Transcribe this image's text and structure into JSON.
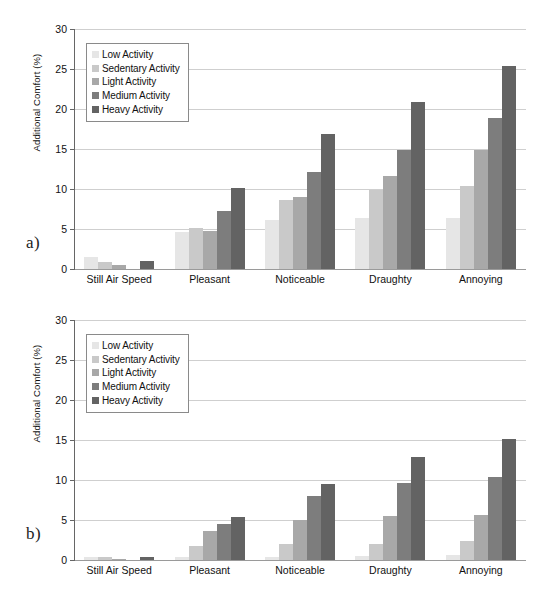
{
  "figure": {
    "panels": [
      {
        "id": "a",
        "label": "a)"
      },
      {
        "id": "b",
        "label": "b)"
      }
    ],
    "series_colors": [
      "#e6e6e6",
      "#c9c9c9",
      "#a8a8a8",
      "#7d7d7d",
      "#636363"
    ],
    "axis": {
      "ylabel": "Additional Comfort (%)",
      "yticks": [
        "0",
        "5",
        "10",
        "15",
        "20",
        "25",
        "30"
      ],
      "ymin": 0,
      "ymax": 30
    },
    "legend": {
      "items": [
        {
          "label": "Low Activity"
        },
        {
          "label": "Sedentary Activity"
        },
        {
          "label": "Light Activity"
        },
        {
          "label": "Medium Activity"
        },
        {
          "label": "Heavy Activity"
        }
      ]
    }
  },
  "chart_data": [
    {
      "type": "bar",
      "panel": "a",
      "title": "",
      "xlabel": "",
      "ylabel": "Additional Comfort (%)",
      "ylim": [
        0,
        30
      ],
      "yticks": [
        0,
        5,
        10,
        15,
        20,
        25,
        30
      ],
      "grid": true,
      "legend_position": "upper-left",
      "categories": [
        "Still Air Speed",
        "Pleasant",
        "Noticeable",
        "Draughty",
        "Annoying"
      ],
      "series": [
        {
          "name": "Low Activity",
          "values": [
            1.4,
            4.5,
            6.0,
            6.3,
            6.3
          ]
        },
        {
          "name": "Sedentary Activity",
          "values": [
            0.8,
            5.0,
            8.5,
            9.8,
            10.3
          ]
        },
        {
          "name": "Light Activity",
          "values": [
            0.4,
            4.6,
            8.9,
            11.5,
            14.7
          ]
        },
        {
          "name": "Medium Activity",
          "values": [
            0.0,
            7.1,
            12.0,
            14.8,
            18.8
          ]
        },
        {
          "name": "Heavy Activity",
          "values": [
            0.9,
            10.0,
            16.7,
            20.7,
            25.2
          ]
        }
      ]
    },
    {
      "type": "bar",
      "panel": "b",
      "title": "",
      "xlabel": "",
      "ylabel": "Additional Comfort (%)",
      "ylim": [
        0,
        30
      ],
      "yticks": [
        0,
        5,
        10,
        15,
        20,
        25,
        30
      ],
      "grid": true,
      "legend_position": "upper-left",
      "categories": [
        "Still Air Speed",
        "Pleasant",
        "Noticeable",
        "Draughty",
        "Annoying"
      ],
      "series": [
        {
          "name": "Low Activity",
          "values": [
            0.2,
            0.3,
            0.3,
            0.4,
            0.5
          ]
        },
        {
          "name": "Sedentary Activity",
          "values": [
            0.2,
            1.6,
            1.9,
            1.9,
            2.2
          ]
        },
        {
          "name": "Light Activity",
          "values": [
            0.1,
            3.5,
            4.9,
            5.4,
            5.5
          ]
        },
        {
          "name": "Medium Activity",
          "values": [
            0.0,
            4.4,
            7.9,
            9.5,
            10.3
          ]
        },
        {
          "name": "Heavy Activity",
          "values": [
            0.3,
            5.3,
            9.4,
            12.7,
            15.0
          ]
        }
      ]
    }
  ]
}
